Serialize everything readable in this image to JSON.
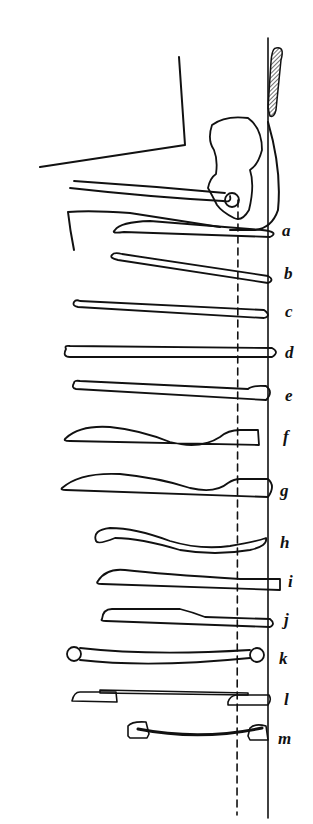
{
  "figure": {
    "line_color": "#111111",
    "background": "#ffffff"
  },
  "labels": [
    {
      "id": "a",
      "text": "a",
      "x": 282,
      "y": 224
    },
    {
      "id": "b",
      "text": "b",
      "x": 284,
      "y": 267
    },
    {
      "id": "c",
      "text": "c",
      "x": 285,
      "y": 304
    },
    {
      "id": "d",
      "text": "d",
      "x": 285,
      "y": 346
    },
    {
      "id": "e",
      "text": "e",
      "x": 285,
      "y": 388
    },
    {
      "id": "f",
      "text": "f",
      "x": 283,
      "y": 430
    },
    {
      "id": "g",
      "text": "g",
      "x": 280,
      "y": 484
    },
    {
      "id": "h",
      "text": "h",
      "x": 280,
      "y": 536
    },
    {
      "id": "i",
      "text": "i",
      "x": 288,
      "y": 575
    },
    {
      "id": "j",
      "text": "j",
      "x": 284,
      "y": 613
    },
    {
      "id": "k",
      "text": "k",
      "x": 279,
      "y": 652
    },
    {
      "id": "l",
      "text": "l",
      "x": 284,
      "y": 693
    },
    {
      "id": "m",
      "text": "m",
      "x": 278,
      "y": 734
    }
  ]
}
